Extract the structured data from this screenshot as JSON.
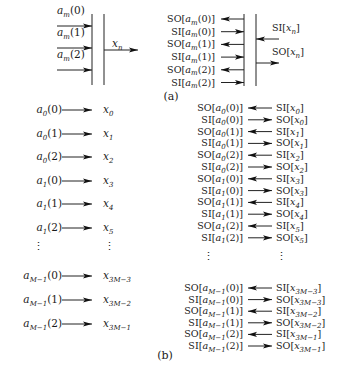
{
  "figure": {
    "panel_a": {
      "caption": "(a)",
      "left": {
        "inputs": [
          {
            "base": "a",
            "sub": "m",
            "arg": "(0)"
          },
          {
            "base": "a",
            "sub": "m",
            "arg": "(1)"
          },
          {
            "base": "a",
            "sub": "m",
            "arg": "(2)"
          }
        ],
        "output": {
          "base": "x",
          "sub": "n"
        }
      },
      "right": {
        "ports": [
          {
            "prefix": "SO",
            "base": "a",
            "sub": "m",
            "arg": "(0)",
            "direction": "out"
          },
          {
            "prefix": "SI",
            "base": "a",
            "sub": "m",
            "arg": "(0)",
            "direction": "in"
          },
          {
            "prefix": "SO",
            "base": "a",
            "sub": "m",
            "arg": "(1)",
            "direction": "out"
          },
          {
            "prefix": "SI",
            "base": "a",
            "sub": "m",
            "arg": "(1)",
            "direction": "in"
          },
          {
            "prefix": "SO",
            "base": "a",
            "sub": "m",
            "arg": "(2)",
            "direction": "out"
          },
          {
            "prefix": "SI",
            "base": "a",
            "sub": "m",
            "arg": "(2)",
            "direction": "in"
          }
        ],
        "outputs": [
          {
            "prefix": "SI",
            "base": "x",
            "sub": "n",
            "direction": "in"
          },
          {
            "prefix": "SO",
            "base": "x",
            "sub": "n",
            "direction": "out"
          }
        ]
      }
    },
    "panel_b": {
      "caption": "(b)",
      "ellipsis": "⋮",
      "left_rows": [
        {
          "a_sub": "0",
          "a_arg": "(0)",
          "x_sub": "0"
        },
        {
          "a_sub": "0",
          "a_arg": "(1)",
          "x_sub": "1"
        },
        {
          "a_sub": "0",
          "a_arg": "(2)",
          "x_sub": "2"
        },
        {
          "a_sub": "1",
          "a_arg": "(0)",
          "x_sub": "3"
        },
        {
          "a_sub": "1",
          "a_arg": "(1)",
          "x_sub": "4"
        },
        {
          "a_sub": "1",
          "a_arg": "(2)",
          "x_sub": "5"
        },
        {
          "ellipsis": true
        },
        {
          "a_sub": "M−1",
          "a_arg": "(0)",
          "x_sub": "3M−3"
        },
        {
          "a_sub": "M−1",
          "a_arg": "(1)",
          "x_sub": "3M−2"
        },
        {
          "a_sub": "M−1",
          "a_arg": "(2)",
          "x_sub": "3M−1"
        }
      ],
      "right_rows": [
        {
          "l_prefix": "SO",
          "a_sub": "0",
          "a_arg": "(0)",
          "r_prefix": "SI",
          "x_sub": "0",
          "dir": "left"
        },
        {
          "l_prefix": "SI",
          "a_sub": "0",
          "a_arg": "(0)",
          "r_prefix": "SO",
          "x_sub": "0",
          "dir": "right"
        },
        {
          "l_prefix": "SO",
          "a_sub": "0",
          "a_arg": "(1)",
          "r_prefix": "SI",
          "x_sub": "1",
          "dir": "left"
        },
        {
          "l_prefix": "SI",
          "a_sub": "0",
          "a_arg": "(1)",
          "r_prefix": "SO",
          "x_sub": "1",
          "dir": "right"
        },
        {
          "l_prefix": "SO",
          "a_sub": "0",
          "a_arg": "(2)",
          "r_prefix": "SI",
          "x_sub": "2",
          "dir": "left"
        },
        {
          "l_prefix": "SI",
          "a_sub": "0",
          "a_arg": "(2)",
          "r_prefix": "SO",
          "x_sub": "2",
          "dir": "right"
        },
        {
          "l_prefix": "SO",
          "a_sub": "1",
          "a_arg": "(0)",
          "r_prefix": "SI",
          "x_sub": "3",
          "dir": "left"
        },
        {
          "l_prefix": "SI",
          "a_sub": "1",
          "a_arg": "(0)",
          "r_prefix": "SO",
          "x_sub": "3",
          "dir": "right"
        },
        {
          "l_prefix": "SO",
          "a_sub": "1",
          "a_arg": "(1)",
          "r_prefix": "SI",
          "x_sub": "4",
          "dir": "left"
        },
        {
          "l_prefix": "SI",
          "a_sub": "1",
          "a_arg": "(1)",
          "r_prefix": "SO",
          "x_sub": "4",
          "dir": "right"
        },
        {
          "l_prefix": "SO",
          "a_sub": "1",
          "a_arg": "(2)",
          "r_prefix": "SI",
          "x_sub": "5",
          "dir": "left"
        },
        {
          "l_prefix": "SI",
          "a_sub": "1",
          "a_arg": "(2)",
          "r_prefix": "SO",
          "x_sub": "5",
          "dir": "right"
        },
        {
          "ellipsis": true
        },
        {
          "l_prefix": "SO",
          "a_sub": "M−1",
          "a_arg": "(0)",
          "r_prefix": "SI",
          "x_sub": "3M−3",
          "dir": "left"
        },
        {
          "l_prefix": "SI",
          "a_sub": "M−1",
          "a_arg": "(0)",
          "r_prefix": "SO",
          "x_sub": "3M−3",
          "dir": "right"
        },
        {
          "l_prefix": "SO",
          "a_sub": "M−1",
          "a_arg": "(1)",
          "r_prefix": "SI",
          "x_sub": "3M−2",
          "dir": "left"
        },
        {
          "l_prefix": "SI",
          "a_sub": "M−1",
          "a_arg": "(1)",
          "r_prefix": "SO",
          "x_sub": "3M−2",
          "dir": "right"
        },
        {
          "l_prefix": "SO",
          "a_sub": "M−1",
          "a_arg": "(2)",
          "r_prefix": "SI",
          "x_sub": "3M−1",
          "dir": "left"
        },
        {
          "l_prefix": "SI",
          "a_sub": "M−1",
          "a_arg": "(2)",
          "r_prefix": "SO",
          "x_sub": "3M−1",
          "dir": "right"
        }
      ]
    }
  }
}
